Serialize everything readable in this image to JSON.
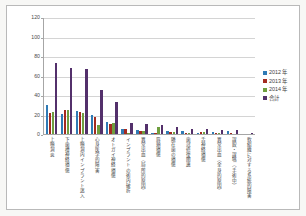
{
  "chart_data": {
    "type": "bar",
    "title": "",
    "xlabel": "",
    "ylabel": "",
    "ylim": [
      0,
      120
    ],
    "yticks": [
      0,
      20,
      40,
      60,
      80,
      100,
      120
    ],
    "grid": true,
    "legend_position": "right",
    "categories": [
      "上顎洞炎",
      "下歯槽神経損傷",
      "上顎洞内インプラント迷入",
      "心身医学的障害",
      "オトガイ神経損傷",
      "インプラントの術内破折",
      "異常出血（局所的原因）",
      "唇頬損傷",
      "隣在歯の損傷",
      "歯冠修復関連",
      "舌神経損傷",
      "異常出血（全身的原因）",
      "誤飲・誤嚥（手術中）",
      "軟組織に対する系統的障害"
    ],
    "series": [
      {
        "name": "2012 年",
        "color": "#2f7ab5",
        "values": [
          30,
          21,
          24,
          19,
          12,
          5,
          4,
          1,
          3,
          3,
          1,
          2,
          3,
          0
        ]
      },
      {
        "name": "2013 年",
        "color": "#a42b20",
        "values": [
          22,
          25,
          23,
          17,
          10,
          5,
          3,
          1,
          2,
          1,
          2,
          1,
          1,
          0
        ]
      },
      {
        "name": "2014 年",
        "color": "#6f9e3f",
        "values": [
          23,
          25,
          22,
          9,
          11,
          1,
          3,
          7,
          2,
          1,
          2,
          1,
          0,
          0
        ]
      },
      {
        "name": "合計",
        "color": "#53306b",
        "values": [
          73,
          68,
          67,
          45,
          33,
          11,
          10,
          9,
          7,
          5,
          5,
          4,
          4,
          1
        ]
      }
    ]
  },
  "legend": {
    "items": [
      {
        "label": "2012 年",
        "color": "#2f7ab5"
      },
      {
        "label": "2013 年",
        "color": "#a42b20"
      },
      {
        "label": "2014 年",
        "color": "#6f9e3f"
      },
      {
        "label": "合計",
        "color": "#53306b"
      }
    ]
  }
}
